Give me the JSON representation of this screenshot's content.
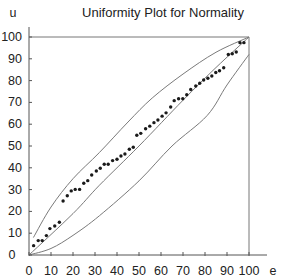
{
  "chart_data": {
    "type": "scatter",
    "title": "Uniformity Plot for Normality",
    "xlabel": "e",
    "ylabel": "u",
    "xlim": [
      0,
      100
    ],
    "ylim": [
      0,
      100
    ],
    "grid": false,
    "legend": null,
    "xticks": [
      0,
      10,
      20,
      30,
      40,
      50,
      60,
      70,
      80,
      90,
      100
    ],
    "yticks": [
      0,
      10,
      20,
      30,
      40,
      50,
      60,
      70,
      80,
      90,
      100
    ],
    "colors": {
      "points": "#1a1a1a",
      "curves": "#7a7a7a",
      "axes": "#555555"
    },
    "points": {
      "name": "observations",
      "x": [
        2.1,
        4.2,
        6.0,
        7.9,
        9.5,
        11.7,
        13.8,
        15.5,
        17.4,
        19.2,
        21.0,
        23.0,
        24.9,
        26.7,
        28.5,
        30.6,
        32.4,
        34.2,
        36.0,
        38.0,
        40.0,
        41.8,
        43.6,
        45.6,
        47.4,
        49.0,
        50.8,
        53.0,
        54.9,
        56.8,
        58.6,
        60.5,
        62.3,
        64.4,
        66.0,
        68.0,
        69.9,
        71.7,
        73.5,
        75.8,
        77.6,
        79.4,
        81.3,
        83.1,
        84.9,
        86.6,
        88.5,
        90.6,
        92.4,
        94.2,
        95.9,
        97.7
      ],
      "y": [
        4.3,
        6.6,
        6.6,
        8.9,
        12.1,
        13.3,
        15.0,
        24.8,
        27.2,
        29.4,
        30.1,
        30.1,
        32.9,
        34.1,
        36.7,
        38.5,
        39.8,
        41.6,
        41.6,
        43.3,
        43.9,
        45.4,
        46.3,
        48.5,
        49.4,
        54.9,
        55.8,
        57.9,
        59.1,
        60.7,
        61.9,
        63.7,
        65.2,
        67.9,
        70.8,
        71.7,
        71.7,
        73.5,
        75.9,
        77.5,
        78.8,
        80.3,
        81.1,
        82.1,
        83.7,
        84.5,
        85.9,
        92.0,
        92.3,
        93.1,
        97.4,
        97.4
      ]
    },
    "curves": [
      {
        "name": "upper-bound",
        "x": [
          2,
          10,
          20,
          32,
          45,
          56,
          70,
          85,
          100
        ],
        "y": [
          8,
          22,
          35,
          47,
          61,
          72,
          83,
          93,
          100
        ]
      },
      {
        "name": "center-line",
        "x": [
          0,
          20,
          32,
          50,
          70,
          85,
          100
        ],
        "y": [
          0,
          19,
          32,
          50,
          71,
          86,
          100
        ]
      },
      {
        "name": "lower-bound",
        "x": [
          0,
          10,
          20,
          32,
          50,
          65,
          81,
          90,
          100
        ],
        "y": [
          0,
          3,
          9,
          18,
          34,
          50,
          64,
          78,
          92
        ]
      }
    ],
    "frame_lines": [
      {
        "name": "top-reference-line",
        "from": [
          0,
          100
        ],
        "to": [
          100,
          100
        ]
      },
      {
        "name": "right-reference-line",
        "from": [
          100,
          0
        ],
        "to": [
          100,
          100
        ]
      }
    ]
  }
}
